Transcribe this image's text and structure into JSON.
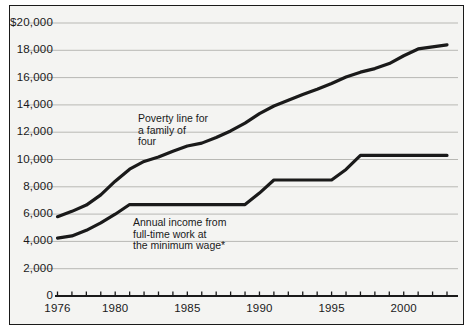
{
  "chart_data": {
    "type": "line",
    "title": "",
    "subtitle": "",
    "xlabel": "",
    "ylabel": "",
    "xlim": [
      1976,
      2003
    ],
    "ylim": [
      0,
      20000
    ],
    "grid": true,
    "legend_position": "inline-annotations",
    "y_ticks": [
      0,
      2000,
      4000,
      6000,
      8000,
      10000,
      12000,
      14000,
      16000,
      18000,
      20000
    ],
    "y_tick_labels": [
      "0",
      "2,000",
      "4,000",
      "6,000",
      "8,000",
      "10,000",
      "12,000",
      "14,000",
      "16,000",
      "18,000",
      "$20,000"
    ],
    "x_ticks": [
      1976,
      1977,
      1978,
      1979,
      1980,
      1981,
      1982,
      1983,
      1984,
      1985,
      1986,
      1987,
      1988,
      1989,
      1990,
      1991,
      1992,
      1993,
      1994,
      1995,
      1996,
      1997,
      1998,
      1999,
      2000,
      2001,
      2002,
      2003
    ],
    "x_tick_labels": [
      "1976",
      "1980",
      "1985",
      "1990",
      "1995",
      "2000"
    ],
    "x_labeled_ticks": [
      1976,
      1980,
      1985,
      1990,
      1995,
      2000
    ],
    "series": [
      {
        "name": "Poverty line for a family of four",
        "color": "#1a1a1a",
        "x": [
          1976,
          1977,
          1978,
          1979,
          1980,
          1981,
          1982,
          1983,
          1984,
          1985,
          1986,
          1987,
          1988,
          1989,
          1990,
          1991,
          1992,
          1993,
          1994,
          1995,
          1996,
          1997,
          1998,
          1999,
          2000,
          2001,
          2002,
          2003
        ],
        "values": [
          5815,
          6200,
          6660,
          7410,
          8410,
          9290,
          9860,
          10180,
          10610,
          10990,
          11200,
          11610,
          12090,
          12670,
          13360,
          13920,
          14340,
          14760,
          15150,
          15570,
          16040,
          16400,
          16660,
          17030,
          17600,
          18100,
          18250,
          18400
        ]
      },
      {
        "name": "Annual income from full-time work at the minimum wage*",
        "color": "#1a1a1a",
        "x": [
          1976,
          1977,
          1978,
          1979,
          1980,
          1981,
          1982,
          1983,
          1984,
          1985,
          1986,
          1987,
          1988,
          1989,
          1990,
          1991,
          1992,
          1993,
          1994,
          1995,
          1996,
          1997,
          1998,
          1999,
          2000,
          2001,
          2002,
          2003
        ],
        "values": [
          4240,
          4400,
          4810,
          5360,
          5990,
          6700,
          6700,
          6700,
          6700,
          6700,
          6700,
          6700,
          6700,
          6700,
          7540,
          8500,
          8500,
          8500,
          8500,
          8500,
          9270,
          10300,
          10300,
          10300,
          10300,
          10300,
          10300,
          10300
        ]
      }
    ],
    "annotations": [
      {
        "name": "poverty-line-annotation",
        "lines": [
          "Poverty line for",
          "a family of",
          "four"
        ],
        "x_px": 138,
        "y_px": 113
      },
      {
        "name": "minimum-wage-annotation",
        "lines": [
          "Annual income from",
          "full-time work at",
          "the minimum wage*"
        ],
        "x_px": 133,
        "y_px": 217
      }
    ],
    "colors": {
      "plot_background": "#f4f4f2",
      "frame": "#1a1a1a",
      "gridline": "#b8b8b4",
      "line": "#1a1a1a",
      "text": "#1a1a1a"
    }
  }
}
